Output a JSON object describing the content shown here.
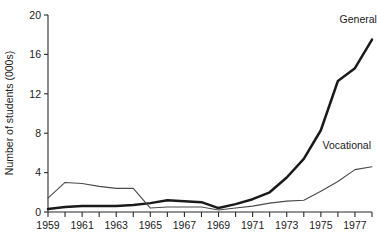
{
  "chart_data": {
    "type": "line",
    "title": "",
    "xlabel": "",
    "ylabel": "Number of students (000s)",
    "xlim": [
      1959,
      1978
    ],
    "ylim": [
      0,
      20
    ],
    "yticks": [
      0,
      4,
      8,
      12,
      16,
      20
    ],
    "ytick_labels": [
      "0",
      "4",
      "8",
      "12",
      "16",
      "20"
    ],
    "x": [
      1959,
      1960,
      1961,
      1962,
      1963,
      1964,
      1965,
      1966,
      1967,
      1968,
      1969,
      1970,
      1971,
      1972,
      1973,
      1974,
      1975,
      1976,
      1977,
      1978
    ],
    "xticks": [
      1959,
      1960,
      1961,
      1962,
      1963,
      1964,
      1965,
      1966,
      1967,
      1968,
      1969,
      1970,
      1971,
      1972,
      1973,
      1974,
      1975,
      1976,
      1977,
      1978
    ],
    "xtick_labels": [
      "1959",
      "",
      "1961",
      "",
      "1963",
      "",
      "1965",
      "",
      "1967",
      "",
      "1969",
      "",
      "1971",
      "",
      "1973",
      "",
      "1975",
      "",
      "1977",
      ""
    ],
    "grid": false,
    "legend_position": "inline-right",
    "series": [
      {
        "name": "General",
        "label": "General",
        "color": "#1a1a1a",
        "line_width": 2.5,
        "values": [
          0.3,
          0.5,
          0.6,
          0.6,
          0.6,
          0.7,
          0.9,
          1.2,
          1.1,
          1.0,
          0.4,
          0.8,
          1.3,
          2.0,
          3.5,
          5.4,
          8.3,
          13.3,
          14.6,
          17.5
        ]
      },
      {
        "name": "Vocational",
        "label": "Vocational",
        "color": "#4a4a4a",
        "line_width": 1.1,
        "values": [
          1.4,
          3.0,
          2.9,
          2.6,
          2.4,
          2.4,
          0.4,
          0.5,
          0.5,
          0.5,
          0.2,
          0.4,
          0.6,
          0.9,
          1.1,
          1.2,
          2.1,
          3.1,
          4.3,
          4.6
        ]
      }
    ],
    "annotations": [
      {
        "text": "General",
        "x": 1976.1,
        "y": 19.2
      },
      {
        "text": "Vocational",
        "x": 1975.1,
        "y": 6.4
      }
    ]
  }
}
